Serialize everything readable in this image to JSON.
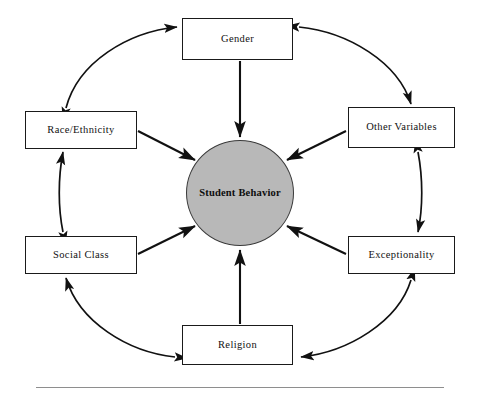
{
  "figure": {
    "center": {
      "label": "Student Behavior",
      "shape": "circle",
      "fill_color": "#b8b8b8",
      "stroke_color": "#3a3a3a"
    },
    "nodes": [
      {
        "id": "gender",
        "label": "Gender",
        "position": "top"
      },
      {
        "id": "other-variables",
        "label": "Other Variables",
        "position": "top-right"
      },
      {
        "id": "exceptionality",
        "label": "Exceptionality",
        "position": "bottom-right"
      },
      {
        "id": "religion",
        "label": "Religion",
        "position": "bottom"
      },
      {
        "id": "social-class",
        "label": "Social Class",
        "position": "bottom-left"
      },
      {
        "id": "race-ethnicity",
        "label": "Race/Ethnicity",
        "position": "top-left"
      }
    ],
    "ring_connections": [
      {
        "from": "race-ethnicity",
        "to": "gender",
        "style": "curved-double-arrow"
      },
      {
        "from": "gender",
        "to": "other-variables",
        "style": "curved-double-arrow"
      },
      {
        "from": "other-variables",
        "to": "exceptionality",
        "style": "curved-double-arrow"
      },
      {
        "from": "exceptionality",
        "to": "religion",
        "style": "curved-double-arrow"
      },
      {
        "from": "religion",
        "to": "social-class",
        "style": "curved-double-arrow"
      },
      {
        "from": "social-class",
        "to": "race-ethnicity",
        "style": "curved-double-arrow"
      }
    ],
    "center_connections": [
      {
        "from": "gender",
        "to": "center",
        "style": "straight-single-arrow"
      },
      {
        "from": "other-variables",
        "to": "center",
        "style": "straight-single-arrow"
      },
      {
        "from": "exceptionality",
        "to": "center",
        "style": "straight-single-arrow"
      },
      {
        "from": "religion",
        "to": "center",
        "style": "straight-single-arrow"
      },
      {
        "from": "social-class",
        "to": "center",
        "style": "straight-single-arrow"
      },
      {
        "from": "race-ethnicity",
        "to": "center",
        "style": "straight-single-arrow"
      }
    ],
    "colors": {
      "line": "#111111",
      "box_border": "#1a1a1a",
      "box_fill": "#ffffff",
      "page_background": "#ffffff",
      "footer_rule": "#8e8e8e"
    }
  }
}
